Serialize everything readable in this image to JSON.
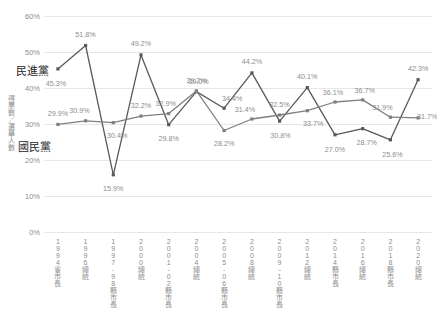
{
  "chart_data": {
    "type": "line",
    "title": "",
    "xlabel": "",
    "ylabel": "得票數／選舉人數",
    "ylim": [
      0,
      60
    ],
    "ytick_labels": [
      "60%",
      "50%",
      "40%",
      "30%",
      "20%",
      "10%",
      "0%"
    ],
    "ytick_values": [
      60,
      50,
      40,
      30,
      20,
      10,
      0
    ],
    "grid": true,
    "legend_position": "inline-left",
    "categories": [
      "1994省市長",
      "1996總統",
      "1997-98縣市長",
      "2000總統",
      "2001-02縣市長",
      "2004總統",
      "2005-06縣市長",
      "2008總統",
      "2009-10縣市長",
      "2012總統",
      "2014縣市長",
      "2016總統",
      "2018縣市長",
      "2020總統"
    ],
    "series": [
      {
        "name": "民進黨",
        "color": "#595959",
        "values": [
          45.3,
          51.8,
          15.9,
          49.2,
          29.8,
          39.0,
          34.4,
          44.2,
          30.8,
          40.1,
          27.0,
          28.7,
          25.6,
          42.3
        ],
        "labels": [
          "45.3%",
          "51.8%",
          "15.9%",
          "49.2%",
          "29.8%",
          "39.0%",
          "34.4%",
          "44.2%",
          "30.8%",
          "40.1%",
          "27.0%",
          "28.7%",
          "25.6%",
          "42.3%"
        ]
      },
      {
        "name": "國民黨",
        "color": "#7f7f7f",
        "values": [
          29.9,
          30.9,
          30.4,
          32.2,
          32.9,
          39.2,
          28.2,
          31.4,
          32.5,
          33.7,
          36.1,
          36.7,
          31.9,
          31.7
        ],
        "labels": [
          "29.9%",
          "30.9%",
          "30.4%",
          "32.2%",
          "32.9%",
          "39.2%",
          "28.2%",
          "31.4%",
          "32.5%",
          "33.7%",
          "36.1%",
          "36.7%",
          "31.9%",
          "31.7%"
        ]
      }
    ]
  },
  "axis": {
    "y_title": "得票數／選舉人數"
  },
  "legend": {
    "dpp": "民進黨",
    "kmt": "國民黨"
  }
}
